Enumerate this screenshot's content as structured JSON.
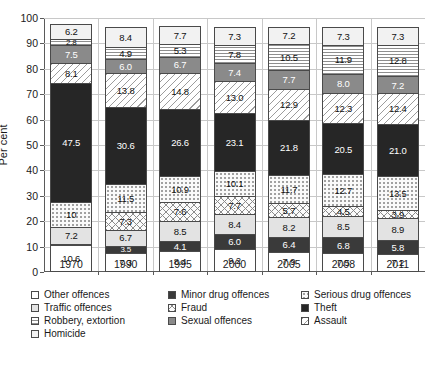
{
  "chart_data": {
    "type": "bar",
    "subtype": "stacked-bar-100-percent",
    "title": "",
    "xlabel": "",
    "ylabel": "Per cent",
    "ylim": [
      0,
      100
    ],
    "ytick_step": 10,
    "yticks": [
      "0",
      "10",
      "20",
      "30",
      "40",
      "50",
      "60",
      "70",
      "80",
      "90",
      "100"
    ],
    "grid": true,
    "legend_position": "bottom",
    "categories": [
      "1970",
      "1990",
      "1995",
      "2000",
      "2005",
      "2008",
      "2011"
    ],
    "series": [
      {
        "name": "Other offences",
        "key": "other",
        "values": [
          10.6,
          7.3,
          8.4,
          9.2,
          7.9,
          7.5,
          7.2
        ]
      },
      {
        "name": "Minor drug offences",
        "key": "minor",
        "values": [
          0.2,
          3.5,
          4.1,
          6.0,
          6.4,
          6.8,
          5.8
        ]
      },
      {
        "name": "Traffic offences",
        "key": "traffic",
        "values": [
          7.2,
          6.7,
          8.5,
          8.4,
          8.2,
          8.5,
          8.9
        ]
      },
      {
        "name": "Fraud",
        "key": "fraud",
        "values": [
          0.0,
          7.3,
          7.6,
          7.7,
          5.7,
          4.5,
          3.9
        ]
      },
      {
        "name": "Serious drug offences",
        "key": "serious",
        "values": [
          10.0,
          11.5,
          10.9,
          10.1,
          11.7,
          12.7,
          13.5
        ]
      },
      {
        "name": "Theft",
        "key": "theft",
        "values": [
          47.5,
          30.6,
          26.6,
          23.1,
          21.8,
          20.5,
          21.0
        ]
      },
      {
        "name": "Assault",
        "key": "assault",
        "values": [
          8.1,
          13.8,
          14.8,
          13.0,
          12.9,
          12.3,
          12.4
        ]
      },
      {
        "name": "Sexual offences",
        "key": "sexual",
        "values": [
          7.5,
          6.0,
          6.7,
          7.4,
          7.7,
          8.0,
          7.2
        ]
      },
      {
        "name": "Robbery, extortion",
        "key": "robbery",
        "values": [
          2.8,
          4.9,
          5.3,
          7.8,
          10.5,
          11.9,
          12.8
        ]
      },
      {
        "name": "Homicide",
        "key": "homicide",
        "values": [
          6.2,
          8.4,
          7.7,
          7.3,
          7.2,
          7.3,
          7.3
        ]
      }
    ],
    "bar_stacks": [
      {
        "category": "1970",
        "segments": [
          {
            "label": "10.6",
            "value": 10.6,
            "key": "other"
          },
          {
            "label": "0.2",
            "value": 0.2,
            "key": "minor"
          },
          {
            "label": "7.2",
            "value": 7.2,
            "key": "traffic"
          },
          {
            "label": "",
            "value": 0.0,
            "key": "fraud"
          },
          {
            "label": "10",
            "value": 10.0,
            "key": "serious"
          },
          {
            "label": "47.5",
            "value": 47.5,
            "key": "theft"
          },
          {
            "label": "8.1",
            "value": 8.1,
            "key": "assault"
          },
          {
            "label": "7.5",
            "value": 7.5,
            "key": "sexual"
          },
          {
            "label": "2.8",
            "value": 2.8,
            "key": "robbery"
          },
          {
            "label": "6.2",
            "value": 6.2,
            "key": "homicide"
          }
        ]
      },
      {
        "category": "1990",
        "segments": [
          {
            "label": "7.3",
            "value": 7.3,
            "key": "other"
          },
          {
            "label": "3.5",
            "value": 3.5,
            "key": "minor"
          },
          {
            "label": "6.7",
            "value": 6.7,
            "key": "traffic"
          },
          {
            "label": "7.3",
            "value": 7.3,
            "key": "fraud"
          },
          {
            "label": "11.5",
            "value": 11.5,
            "key": "serious"
          },
          {
            "label": "30.6",
            "value": 30.6,
            "key": "theft"
          },
          {
            "label": "13.8",
            "value": 13.8,
            "key": "assault"
          },
          {
            "label": "6.0",
            "value": 6.0,
            "key": "sexual"
          },
          {
            "label": "4.9",
            "value": 4.9,
            "key": "robbery"
          },
          {
            "label": "8.4",
            "value": 8.4,
            "key": "homicide"
          }
        ]
      },
      {
        "category": "1995",
        "segments": [
          {
            "label": "8.4",
            "value": 8.4,
            "key": "other"
          },
          {
            "label": "4.1",
            "value": 4.1,
            "key": "minor"
          },
          {
            "label": "8.5",
            "value": 8.5,
            "key": "traffic"
          },
          {
            "label": "7.6",
            "value": 7.6,
            "key": "fraud"
          },
          {
            "label": "10.9",
            "value": 10.9,
            "key": "serious"
          },
          {
            "label": "26.6",
            "value": 26.6,
            "key": "theft"
          },
          {
            "label": "14.8",
            "value": 14.8,
            "key": "assault"
          },
          {
            "label": "6.7",
            "value": 6.7,
            "key": "sexual"
          },
          {
            "label": "5.3",
            "value": 5.3,
            "key": "robbery"
          },
          {
            "label": "7.7",
            "value": 7.7,
            "key": "homicide"
          }
        ]
      },
      {
        "category": "2000",
        "segments": [
          {
            "label": "9.2",
            "value": 9.2,
            "key": "other"
          },
          {
            "label": "6.0",
            "value": 6.0,
            "key": "minor"
          },
          {
            "label": "8.4",
            "value": 8.4,
            "key": "traffic"
          },
          {
            "label": "7.7",
            "value": 7.7,
            "key": "fraud"
          },
          {
            "label": "10.1",
            "value": 10.1,
            "key": "serious"
          },
          {
            "label": "23.1",
            "value": 23.1,
            "key": "theft"
          },
          {
            "label": "13.0",
            "value": 13.0,
            "key": "assault"
          },
          {
            "label": "7.4",
            "value": 7.4,
            "key": "sexual"
          },
          {
            "label": "7.8",
            "value": 7.8,
            "key": "robbery"
          },
          {
            "label": "7.3",
            "value": 7.3,
            "key": "homicide"
          }
        ]
      },
      {
        "category": "2005",
        "segments": [
          {
            "label": "7.9",
            "value": 7.9,
            "key": "other"
          },
          {
            "label": "6.4",
            "value": 6.4,
            "key": "minor"
          },
          {
            "label": "8.2",
            "value": 8.2,
            "key": "traffic"
          },
          {
            "label": "5.7",
            "value": 5.7,
            "key": "fraud"
          },
          {
            "label": "11.7",
            "value": 11.7,
            "key": "serious"
          },
          {
            "label": "21.8",
            "value": 21.8,
            "key": "theft"
          },
          {
            "label": "12.9",
            "value": 12.9,
            "key": "assault"
          },
          {
            "label": "7.7",
            "value": 7.7,
            "key": "sexual"
          },
          {
            "label": "10.5",
            "value": 10.5,
            "key": "robbery"
          },
          {
            "label": "7.2",
            "value": 7.2,
            "key": "homicide"
          }
        ]
      },
      {
        "category": "2008",
        "segments": [
          {
            "label": "7.5",
            "value": 7.5,
            "key": "other"
          },
          {
            "label": "6.8",
            "value": 6.8,
            "key": "minor"
          },
          {
            "label": "8.5",
            "value": 8.5,
            "key": "traffic"
          },
          {
            "label": "4.5",
            "value": 4.5,
            "key": "fraud"
          },
          {
            "label": "12.7",
            "value": 12.7,
            "key": "serious"
          },
          {
            "label": "20.5",
            "value": 20.5,
            "key": "theft"
          },
          {
            "label": "12.3",
            "value": 12.3,
            "key": "assault"
          },
          {
            "label": "8.0",
            "value": 8.0,
            "key": "sexual"
          },
          {
            "label": "11.9",
            "value": 11.9,
            "key": "robbery"
          },
          {
            "label": "7.3",
            "value": 7.3,
            "key": "homicide"
          }
        ]
      },
      {
        "category": "2011",
        "segments": [
          {
            "label": "7.2",
            "value": 7.2,
            "key": "other"
          },
          {
            "label": "5.8",
            "value": 5.8,
            "key": "minor"
          },
          {
            "label": "8.9",
            "value": 8.9,
            "key": "traffic"
          },
          {
            "label": "3.9",
            "value": 3.9,
            "key": "fraud"
          },
          {
            "label": "13.5",
            "value": 13.5,
            "key": "serious"
          },
          {
            "label": "21.0",
            "value": 21.0,
            "key": "theft"
          },
          {
            "label": "12.4",
            "value": 12.4,
            "key": "assault"
          },
          {
            "label": "7.2",
            "value": 7.2,
            "key": "sexual"
          },
          {
            "label": "12.8",
            "value": 12.8,
            "key": "robbery"
          },
          {
            "label": "7.3",
            "value": 7.3,
            "key": "homicide"
          }
        ]
      }
    ],
    "legend": [
      {
        "label": "Other offences",
        "key": "other",
        "column": 0
      },
      {
        "label": "Traffic offences",
        "key": "traffic",
        "column": 0
      },
      {
        "label": "Robbery, extortion",
        "key": "robbery",
        "column": 0
      },
      {
        "label": "Homicide",
        "key": "homicide",
        "column": 0
      },
      {
        "label": "Minor drug offences",
        "key": "minor",
        "column": 1
      },
      {
        "label": "Fraud",
        "key": "fraud",
        "column": 1
      },
      {
        "label": "Sexual offences",
        "key": "sexual",
        "column": 1
      },
      {
        "label": "Serious drug offences",
        "key": "serious",
        "column": 2
      },
      {
        "label": "Theft",
        "key": "theft",
        "column": 2
      },
      {
        "label": "Assault",
        "key": "assault",
        "column": 2
      }
    ],
    "colors": {
      "other": "#ffffff",
      "traffic": "#e3e3e3",
      "robbery": "#ffffff",
      "homicide": "#f2f2f2",
      "minor": "#3a3a3a",
      "fraud": "#fbfbfb",
      "sexual": "#8a8a8a",
      "serious": "#fafafa",
      "theft": "#262626",
      "assault": "#ffffff",
      "axis": "#5a5a5a",
      "grid": "#c8c8c8"
    }
  },
  "caption": {
    "text": ""
  }
}
